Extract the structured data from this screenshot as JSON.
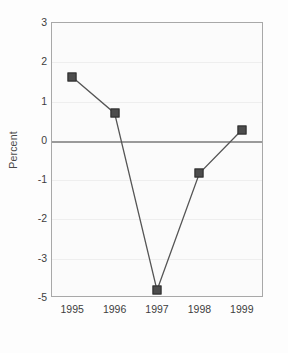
{
  "chart_data": {
    "type": "line",
    "title": "",
    "subtitle": "",
    "xlabel": "",
    "ylabel": "Percent",
    "categories": [
      "1995",
      "1996",
      "1997",
      "1998",
      "1999"
    ],
    "x": [
      1995,
      1996,
      1997,
      1998,
      1999
    ],
    "values": [
      1.6,
      0.68,
      -4.65,
      -0.85,
      0.25
    ],
    "series": [
      {
        "name": "Percent",
        "values": [
          1.6,
          0.68,
          -4.65,
          -0.85,
          0.25
        ]
      }
    ],
    "ytick_labels": [
      "3",
      "2",
      "1",
      "0",
      "-1",
      "-2",
      "-3",
      "-5"
    ],
    "ytick_values": [
      3,
      2,
      1,
      0,
      -1,
      -2,
      -3,
      -5
    ],
    "xtick_labels": [
      "1995",
      "1996",
      "1997",
      "1998",
      "1999"
    ],
    "ylim": [
      -5,
      3
    ],
    "xlim": [
      1994.6,
      1999.4
    ],
    "grid": true,
    "legend": false,
    "legend_position": "none",
    "marker": "square",
    "annotations": [],
    "colors": {
      "line": "#555555",
      "marker_fill": "#4d4d4d",
      "marker_edge": "#2e2e2e",
      "axis": "#a8a8a8",
      "zero_line": "#9a9a9a",
      "grid": "#eeeeee",
      "text": "#3d3d3d",
      "plot_background": "#fbfbfb",
      "figure_background": "#fdfdfd"
    }
  }
}
